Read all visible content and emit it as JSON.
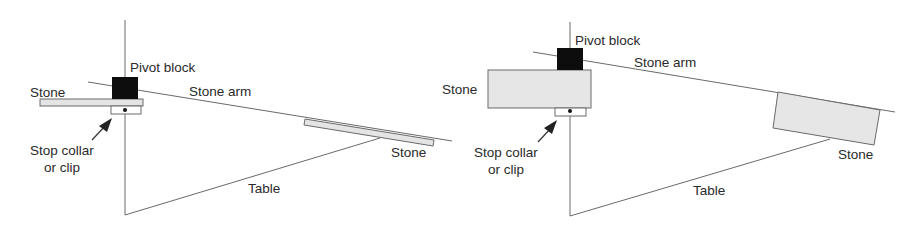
{
  "diagram": {
    "panels": [
      {
        "id": "thin-stone-setup",
        "labels": {
          "pivot_block": "Pivot block",
          "stone_left": "Stone",
          "stone_arm": "Stone arm",
          "stone_right": "Stone",
          "stop_collar_line1": "Stop collar",
          "stop_collar_line2": "or clip",
          "table": "Table"
        }
      },
      {
        "id": "thick-stone-setup",
        "labels": {
          "pivot_block": "Pivot block",
          "stone_left": "Stone",
          "stone_arm": "Stone arm",
          "stone_right": "Stone",
          "stop_collar_line1": "Stop collar",
          "stop_collar_line2": "or clip",
          "table": "Table"
        }
      }
    ],
    "colors": {
      "line": "#6a6a6a",
      "stone_fill": "#e4e4e4",
      "pivot_block": "#0d0d0d",
      "text": "#2a2a2a"
    }
  }
}
